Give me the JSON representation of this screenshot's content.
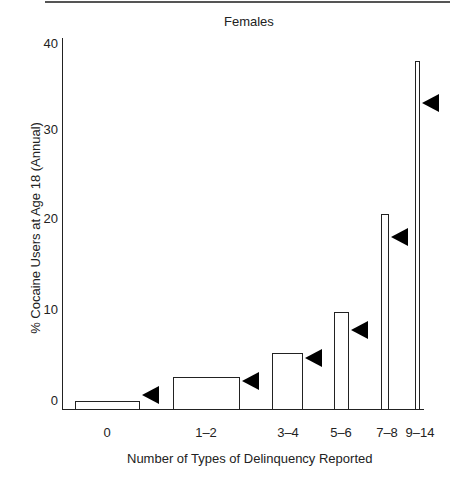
{
  "chart_data": {
    "type": "bar",
    "title": "Females",
    "xlabel": "Number of Types of Delinquency Reported",
    "ylabel": "% Cocaine Users at Age 18 (Annual)",
    "ylim": [
      0,
      40
    ],
    "yticks": [
      0,
      10,
      20,
      30,
      40
    ],
    "grid": false,
    "legend": null,
    "categories": [
      "0",
      "1–2",
      "3–4",
      "5–6",
      "7–8",
      "9–14"
    ],
    "values": [
      0.9,
      3.4,
      6.0,
      10.5,
      21.0,
      37.5
    ],
    "marker_values": [
      1.5,
      3.0,
      5.5,
      8.5,
      18.5,
      33.0
    ],
    "annotations": "Black left-pointing triangles beside each bar mark a secondary reference value"
  },
  "chart": {
    "title": "Females",
    "xlabel": "Number of Types of Delinquency Reported",
    "ylabel": "% Cocaine Users at Age 18 (Annual)",
    "yticks": [
      "0",
      "10",
      "20",
      "30",
      "40"
    ],
    "xticks": [
      "0",
      "1–2",
      "3–4",
      "5–6",
      "7–8",
      "9–14"
    ]
  }
}
